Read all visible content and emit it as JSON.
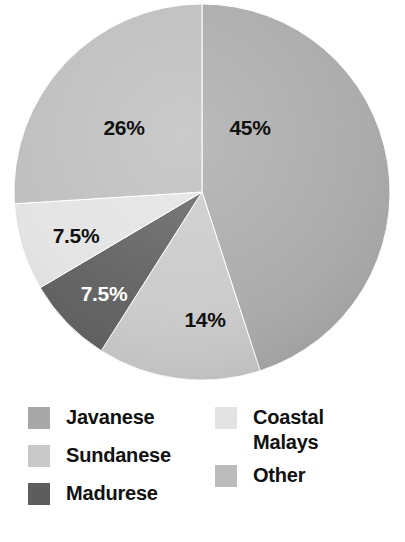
{
  "chart_data": {
    "type": "pie",
    "title": "",
    "subtitle": "",
    "xlabel": "",
    "ylabel": "",
    "grid": false,
    "legend_position": "bottom",
    "center": {
      "x": 202,
      "y": 192
    },
    "radius": 188,
    "start_angle_deg": 0,
    "direction": "clockwise",
    "categories": [
      "Javanese",
      "Sundanese",
      "Madurese",
      "Coastal Malays",
      "Other"
    ],
    "values": [
      45,
      14,
      7.5,
      7.5,
      26
    ],
    "value_labels": [
      "45%",
      "14%",
      "7.5%",
      "7.5%",
      "26%"
    ],
    "colors": [
      "#a8a8a8",
      "#c9c9c9",
      "#5d5d5d",
      "#e3e3e3",
      "#bcbcbc"
    ],
    "slices": [
      {
        "name": "Javanese",
        "value": 45,
        "label": "45%",
        "color": "#a8a8a8",
        "start_deg": 0,
        "end_deg": 162,
        "label_x": 250,
        "label_y": 128,
        "label_color": "#111111"
      },
      {
        "name": "Sundanese",
        "value": 14,
        "label": "14%",
        "color": "#c9c9c9",
        "start_deg": 162,
        "end_deg": 212.4,
        "label_x": 205,
        "label_y": 320,
        "label_color": "#111111"
      },
      {
        "name": "Madurese",
        "value": 7.5,
        "label": "7.5%",
        "color": "#5d5d5d",
        "start_deg": 212.4,
        "end_deg": 239.4,
        "label_x": 104,
        "label_y": 294,
        "label_color": "#ffffff"
      },
      {
        "name": "Coastal Malays",
        "value": 7.5,
        "label": "7.5%",
        "color": "#e3e3e3",
        "start_deg": 239.4,
        "end_deg": 266.4,
        "label_x": 76,
        "label_y": 236,
        "label_color": "#111111"
      },
      {
        "name": "Other",
        "value": 26,
        "label": "26%",
        "color": "#bcbcbc",
        "start_deg": 266.4,
        "end_deg": 360,
        "label_x": 124,
        "label_y": 128,
        "label_color": "#111111"
      }
    ]
  },
  "legend": {
    "left_column": [
      {
        "label": "Javanese",
        "color": "#a8a8a8",
        "swatch_name": "legend-swatch-javanese",
        "top": 20
      },
      {
        "label": "Sundanese",
        "color": "#c9c9c9",
        "swatch_name": "legend-swatch-sundanese",
        "top": 58
      },
      {
        "label": "Madurese",
        "color": "#5d5d5d",
        "swatch_name": "legend-swatch-madurese",
        "top": 96
      }
    ],
    "right_column": [
      {
        "label": "Coastal\nMalays",
        "color": "#e3e3e3",
        "swatch_name": "legend-swatch-coastal-malays",
        "top": 20
      },
      {
        "label": "Other",
        "color": "#bcbcbc",
        "swatch_name": "legend-swatch-other",
        "top": 78
      }
    ]
  },
  "canvas": {
    "background": "#ffffff",
    "width": 405,
    "height": 542
  }
}
